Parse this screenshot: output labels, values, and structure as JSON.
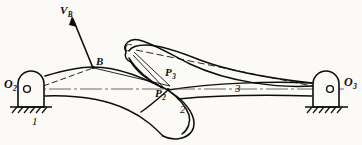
{
  "figure": {
    "type": "kinematic-linkage-diagram",
    "background_color": "#fbfaf7",
    "line_color": "#0d0d0d",
    "width": 362,
    "height": 145
  },
  "labels": {
    "pivot_left": {
      "base": "O",
      "sub": "2"
    },
    "pivot_right": {
      "base": "O",
      "sub": "3"
    },
    "point_b": "B",
    "point_c": "C",
    "point_p2": {
      "base": "P",
      "sub": "2"
    },
    "point_p3": {
      "base": "P",
      "sub": "3"
    },
    "velocity_b": {
      "base": "V",
      "sub": "B"
    },
    "link_1": "1",
    "link_2": "2",
    "link_3": "3"
  },
  "geometry": {
    "pivot_left_center": [
      27,
      89
    ],
    "pivot_right_center": [
      330,
      89
    ],
    "point_b": [
      93,
      68
    ],
    "point_c": [
      131,
      48
    ],
    "point_p2": [
      168,
      90
    ],
    "point_p3": [
      170,
      85
    ],
    "velocity_arrow_tip": [
      72,
      17
    ],
    "velocity_arrow_tail": [
      93,
      68
    ]
  },
  "ground_supports": [
    {
      "name": "left",
      "x_start": 10,
      "x_end": 52,
      "y": 107
    },
    {
      "name": "right",
      "x_start": 305,
      "x_end": 348,
      "y": 107
    }
  ]
}
